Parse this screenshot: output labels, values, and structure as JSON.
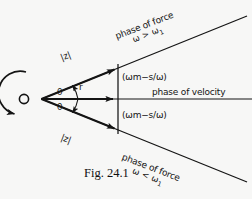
{
  "figure": {
    "caption": "Fig. 24.1",
    "origin_label": "O",
    "radius_label": "r",
    "angle_label_upper": "θ",
    "angle_label_lower": "θ",
    "magnitude_label_upper": "|z|",
    "magnitude_label_lower": "|z|",
    "reactance_label_upper": "(ωm−s/ω)",
    "reactance_label_lower": "(ωm−s/ω)",
    "velocity_label": "phase of velocity",
    "force_upper_line1": "phase of force",
    "force_upper_line2": "ω > ω",
    "force_upper_sub": "1",
    "force_lower_line1": "phase of force",
    "force_lower_line2": "ω < ω",
    "force_lower_sub": "1",
    "rotation_arrow_name": "counterclockwise-rotation-arrow"
  },
  "colors": {
    "background": "#f7f7f6",
    "ink": "#141414"
  }
}
